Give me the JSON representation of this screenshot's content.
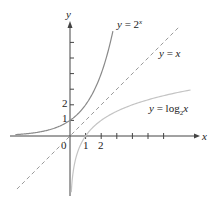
{
  "chart_data": {
    "type": "line",
    "title": "",
    "xlabel": "x",
    "ylabel": "y",
    "origin_label": "0",
    "x_tick_labels": [
      "1",
      "2"
    ],
    "y_tick_labels": [
      "1",
      "2"
    ],
    "x_ticks": [
      1,
      2,
      3,
      4,
      5,
      6
    ],
    "y_ticks": [
      1,
      2,
      3,
      4,
      5,
      6
    ],
    "xlim": [
      -4,
      7.6
    ],
    "ylim": [
      -4.5,
      6.8
    ],
    "grid": false,
    "series": [
      {
        "name": "y = 2^x",
        "label_main": "y = 2",
        "label_sup": "x",
        "style": "solid",
        "color": "#8a8a8a",
        "x": [
          -3.5,
          -2,
          -1,
          0,
          1,
          2,
          2.7
        ],
        "y": [
          0.088,
          0.25,
          0.5,
          1,
          2,
          4,
          6.5
        ]
      },
      {
        "name": "y = x",
        "label_main": "y = x",
        "style": "dashed",
        "color": "#9a9a9a",
        "x": [
          -3.4,
          7
        ],
        "y": [
          -3.4,
          7
        ]
      },
      {
        "name": "y = log2 x",
        "label_main": "y = log",
        "label_sub": "2",
        "label_tail": "x",
        "style": "solid",
        "color": "#c4c4c4",
        "x": [
          0.088,
          0.25,
          0.5,
          1,
          2,
          4,
          7.5
        ],
        "y": [
          -3.5,
          -2,
          -1,
          0,
          1,
          2,
          2.9
        ]
      }
    ]
  }
}
